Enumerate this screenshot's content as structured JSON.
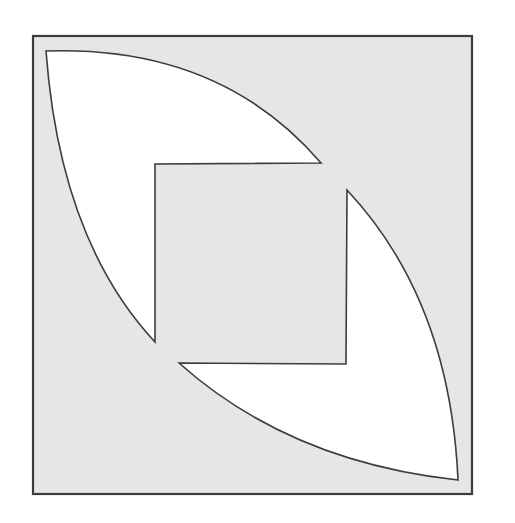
{
  "diagram": {
    "title": "",
    "colors": {
      "background": "#ffffff",
      "square_fill": "#e6e6e6",
      "cutout_fill": "#ffffff",
      "stroke": "#3c3c3c"
    },
    "outer_square": {
      "x": 33,
      "y": 36,
      "width": 439,
      "height": 458
    },
    "shapes": [
      {
        "name": "upper-left-cutout",
        "path": "M46,51 Q220,45 321,163 L155,164 L155,342 Q60,240 46,51 Z"
      },
      {
        "name": "lower-right-cutout",
        "path": "M458,480 Q450,300 347,190 L346,364 L179,363 Q290,462 458,480 Z"
      }
    ]
  }
}
